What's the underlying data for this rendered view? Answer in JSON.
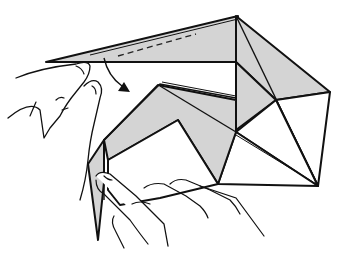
{
  "figure": {
    "type": "origami-instruction-step",
    "colors": {
      "paper_shaded": "#d4d4d4",
      "paper_white": "#ffffff",
      "line": "#111111",
      "background": "#ffffff"
    },
    "symbols": [
      {
        "name": "valley-fold-line",
        "style": "dashed"
      },
      {
        "name": "fold-direction-arrow",
        "direction": "down-right"
      }
    ],
    "hands": [
      {
        "name": "left-hand",
        "position": "upper-left",
        "action": "pinching top flap tip"
      },
      {
        "name": "right-hand",
        "position": "bottom",
        "action": "holding lower-left flap"
      }
    ]
  }
}
